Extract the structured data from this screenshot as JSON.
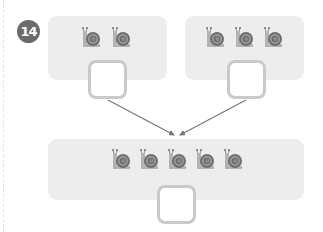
{
  "exercise": {
    "number": "14",
    "badge_color": "#6b6b6b",
    "panel_color": "#ededed",
    "answer_border_color": "#c9c9c9",
    "arrow_color": "#777777"
  },
  "groups": {
    "top_left": {
      "snail_count": 2,
      "answer_value": ""
    },
    "top_right": {
      "snail_count": 3,
      "answer_value": ""
    },
    "bottom": {
      "snail_count": 5,
      "answer_value": ""
    }
  },
  "icons": {
    "snail": "snail-icon",
    "arrow": "arrow-icon"
  }
}
